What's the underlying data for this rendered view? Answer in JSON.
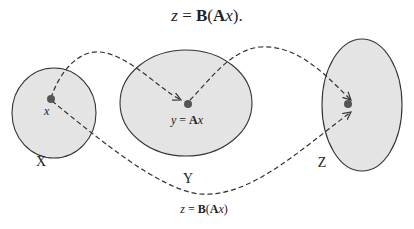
{
  "title": {
    "parts": [
      {
        "text": "z",
        "style": "italic"
      },
      {
        "text": " = ",
        "style": "normal"
      },
      {
        "text": "B",
        "style": "bold"
      },
      {
        "text": "(",
        "style": "normal"
      },
      {
        "text": "A",
        "style": "bold"
      },
      {
        "text": "x",
        "style": "italic"
      },
      {
        "text": ").",
        "style": "normal"
      }
    ]
  },
  "sets": [
    {
      "name": "X",
      "label": "X",
      "point_label": "x"
    },
    {
      "name": "Y",
      "label": "Y",
      "point_label_parts": [
        "y",
        " = ",
        "A",
        "x"
      ]
    },
    {
      "name": "Z",
      "label": "Z"
    }
  ],
  "composite_label": {
    "parts": [
      "z",
      " = ",
      "B",
      "(",
      "A",
      "x",
      ")"
    ]
  },
  "colors": {
    "set_fill": "#e4e4e4",
    "set_stroke": "#333333",
    "point": "#555555",
    "arrow": "#333333"
  }
}
